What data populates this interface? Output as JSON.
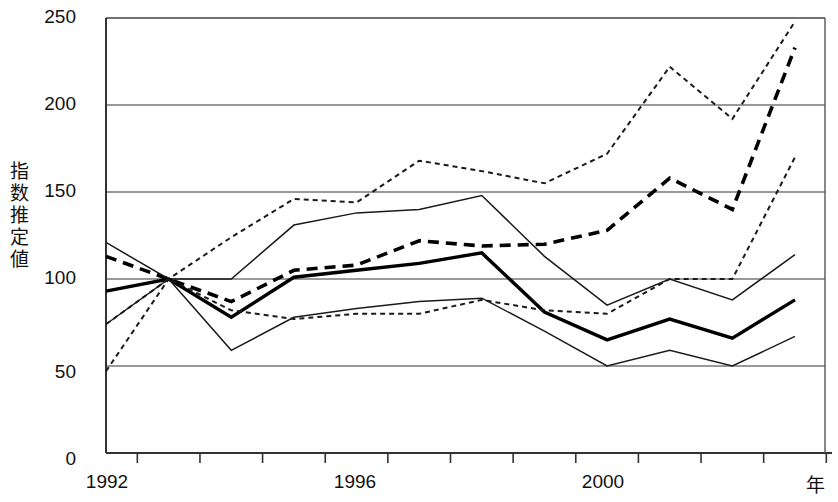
{
  "chart_data": {
    "type": "line",
    "title": "",
    "xlabel": "年",
    "ylabel": "指数推定値",
    "x": [
      1992,
      1993,
      1994,
      1995,
      1996,
      1997,
      1998,
      1999,
      2000,
      2001,
      2002,
      2003
    ],
    "xlim": [
      1992,
      2003
    ],
    "ylim": [
      0,
      250
    ],
    "yticks": [
      0,
      50,
      100,
      150,
      200,
      250
    ],
    "xticks_labeled": [
      1992,
      1996,
      2000
    ],
    "grid": "horizontal",
    "legend": "none",
    "series": [
      {
        "name": "series-1-fine-dotted-upper",
        "style": "fine-dotted",
        "values": [
          47,
          100,
          124,
          146,
          144,
          168,
          162,
          155,
          172,
          222,
          192,
          248
        ]
      },
      {
        "name": "series-2-bold-dashed",
        "style": "bold-dashed",
        "values": [
          113,
          100,
          87,
          105,
          108,
          122,
          119,
          120,
          128,
          158,
          140,
          233
        ]
      },
      {
        "name": "series-3-thin-solid-upper",
        "style": "thin-solid",
        "values": [
          121,
          100,
          100,
          131,
          138,
          140,
          148,
          113,
          85,
          100,
          88,
          114
        ]
      },
      {
        "name": "series-4-bold-solid",
        "style": "bold-solid",
        "values": [
          93,
          100,
          78,
          101,
          105,
          109,
          115,
          81,
          65,
          77,
          66,
          88
        ]
      },
      {
        "name": "series-5-thin-solid-lower",
        "style": "thin-solid",
        "values": [
          74,
          100,
          59,
          78,
          83,
          87,
          89,
          70,
          50,
          59,
          50,
          67
        ]
      },
      {
        "name": "series-6-fine-dotted-lower",
        "style": "fine-dotted",
        "values": [
          74,
          100,
          82,
          77,
          80,
          80,
          88,
          82,
          80,
          100,
          100,
          170
        ]
      }
    ],
    "ytick_labels": [
      "250",
      "200",
      "150",
      "100",
      "50",
      "0"
    ],
    "xtick_labels": [
      "1992",
      "1996",
      "2000"
    ]
  },
  "axis": {
    "y_title": "指数推定値",
    "x_title": "年"
  }
}
